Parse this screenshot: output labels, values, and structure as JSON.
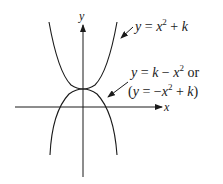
{
  "diagram": {
    "axes": {
      "x_label": "x",
      "y_label": "y"
    },
    "curves": [
      {
        "name": "upward-parabola",
        "equation": "y = x^2 + k",
        "opens": "up"
      },
      {
        "name": "downward-parabola",
        "equation": "y = k - x^2",
        "alt_equation": "(y = -x^2 + k)",
        "opens": "down"
      }
    ],
    "labels": {
      "upper": {
        "y": "y",
        "eq": " = ",
        "x": "x",
        "sup": "2",
        "plus": " + ",
        "k": "k"
      },
      "lower_line1": {
        "y": "y",
        "eq": " = ",
        "k": "k",
        "minus": " − ",
        "x": "x",
        "sup": "2",
        "or": " or"
      },
      "lower_line2": {
        "open": "(",
        "y": "y",
        "eq": " = −",
        "x": "x",
        "sup": "2",
        "plus": " + ",
        "k": "k",
        "close": ")"
      }
    },
    "colors": {
      "stroke": "#1a1a1a",
      "background": "#ffffff"
    }
  }
}
